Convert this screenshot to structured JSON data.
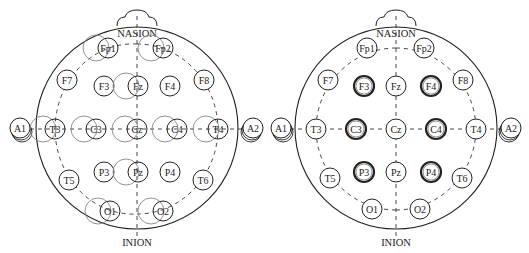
{
  "diagrams": [
    {
      "id": "left",
      "description": "10-20 system with overlapping shifted electrode positions",
      "center_x": 137,
      "labels": {
        "top": "NASION",
        "bottom": "INION"
      },
      "electrodes": [
        {
          "name": "Fp1",
          "x": 108,
          "y": 48,
          "ghost": true,
          "ghost_dx": -12,
          "bold": false
        },
        {
          "name": "Fp2",
          "x": 163,
          "y": 48,
          "ghost": true,
          "ghost_dx": -12,
          "bold": false
        },
        {
          "name": "F7",
          "x": 67,
          "y": 80,
          "ghost": false,
          "bold": false
        },
        {
          "name": "F3",
          "x": 104,
          "y": 86,
          "ghost": false,
          "bold": false
        },
        {
          "name": "Fz",
          "x": 138,
          "y": 86,
          "ghost": true,
          "ghost_dx": -12,
          "bold": false
        },
        {
          "name": "F4",
          "x": 170,
          "y": 86,
          "ghost": false,
          "bold": false
        },
        {
          "name": "F8",
          "x": 204,
          "y": 80,
          "ghost": false,
          "bold": false
        },
        {
          "name": "A1",
          "x": 20,
          "y": 128,
          "ghost": false,
          "ear": true,
          "bold": false
        },
        {
          "name": "T3",
          "x": 55,
          "y": 129,
          "ghost": true,
          "ghost_dx": -12,
          "bold": false
        },
        {
          "name": "C3",
          "x": 96,
          "y": 129,
          "ghost": true,
          "ghost_dx": -12,
          "bold": false
        },
        {
          "name": "Cz",
          "x": 137,
          "y": 129,
          "ghost": true,
          "ghost_dx": -12,
          "bold": false
        },
        {
          "name": "C4",
          "x": 177,
          "y": 129,
          "ghost": true,
          "ghost_dx": -12,
          "bold": false
        },
        {
          "name": "T4",
          "x": 218,
          "y": 129,
          "ghost": true,
          "ghost_dx": -12,
          "bold": false
        },
        {
          "name": "A2",
          "x": 253,
          "y": 128,
          "ghost": false,
          "ear": true,
          "bold": false
        },
        {
          "name": "T5",
          "x": 69,
          "y": 180,
          "ghost": false,
          "bold": false
        },
        {
          "name": "P3",
          "x": 104,
          "y": 172,
          "ghost": false,
          "bold": false
        },
        {
          "name": "Pz",
          "x": 138,
          "y": 172,
          "ghost": true,
          "ghost_dx": -12,
          "bold": false
        },
        {
          "name": "P4",
          "x": 170,
          "y": 172,
          "ghost": false,
          "bold": false
        },
        {
          "name": "T6",
          "x": 203,
          "y": 180,
          "ghost": false,
          "bold": false
        },
        {
          "name": "O1",
          "x": 110,
          "y": 211,
          "ghost": true,
          "ghost_dx": -12,
          "bold": false
        },
        {
          "name": "O2",
          "x": 163,
          "y": 211,
          "ghost": true,
          "ghost_dx": -12,
          "bold": false
        }
      ]
    },
    {
      "id": "right",
      "description": "10-20 system with highlighted electrodes F3, F4, C3, C4, P3, P4",
      "center_x": 396,
      "labels": {
        "top": "NASION",
        "bottom": "INION"
      },
      "electrodes": [
        {
          "name": "Fp1",
          "x": 367,
          "y": 48,
          "bold": false
        },
        {
          "name": "Fp2",
          "x": 424,
          "y": 48,
          "bold": false
        },
        {
          "name": "F7",
          "x": 328,
          "y": 80,
          "bold": false
        },
        {
          "name": "F3",
          "x": 364,
          "y": 86,
          "bold": true
        },
        {
          "name": "Fz",
          "x": 396,
          "y": 86,
          "bold": false
        },
        {
          "name": "F4",
          "x": 431,
          "y": 86,
          "bold": true
        },
        {
          "name": "F8",
          "x": 463,
          "y": 80,
          "bold": false
        },
        {
          "name": "A1",
          "x": 281,
          "y": 128,
          "ear": true,
          "bold": false
        },
        {
          "name": "T3",
          "x": 316,
          "y": 129,
          "bold": false
        },
        {
          "name": "C3",
          "x": 356,
          "y": 129,
          "bold": true
        },
        {
          "name": "Cz",
          "x": 396,
          "y": 129,
          "bold": false
        },
        {
          "name": "C4",
          "x": 436,
          "y": 129,
          "bold": true
        },
        {
          "name": "T4",
          "x": 476,
          "y": 129,
          "bold": false
        },
        {
          "name": "A2",
          "x": 511,
          "y": 128,
          "ear": true,
          "bold": false
        },
        {
          "name": "T5",
          "x": 330,
          "y": 178,
          "bold": false
        },
        {
          "name": "P3",
          "x": 364,
          "y": 172,
          "bold": true
        },
        {
          "name": "Pz",
          "x": 396,
          "y": 172,
          "bold": false
        },
        {
          "name": "P4",
          "x": 431,
          "y": 172,
          "bold": true
        },
        {
          "name": "T6",
          "x": 462,
          "y": 178,
          "bold": false
        },
        {
          "name": "O1",
          "x": 372,
          "y": 209,
          "bold": false
        },
        {
          "name": "O2",
          "x": 420,
          "y": 209,
          "bold": false
        }
      ]
    }
  ],
  "colors": {
    "stroke": "#222222",
    "ghost_stroke": "#888888",
    "background": "#ffffff"
  }
}
